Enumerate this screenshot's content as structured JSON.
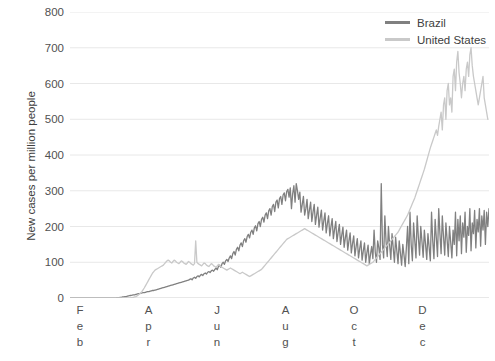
{
  "chart_data": {
    "type": "line",
    "title": "",
    "subtitle": "",
    "xlabel": "",
    "ylabel": "New cases per million people",
    "ylim": [
      0,
      800
    ],
    "yticks": [
      0,
      100,
      200,
      300,
      400,
      500,
      600,
      700,
      800
    ],
    "xticks": [
      "Feb",
      "Apr",
      "Jun",
      "Aug",
      "Oct",
      "Dec"
    ],
    "xtick_letters": [
      [
        "F",
        "e",
        "b"
      ],
      [
        "A",
        "p",
        "r"
      ],
      [
        "J",
        "u",
        "n"
      ],
      [
        "A",
        "u",
        "g"
      ],
      [
        "O",
        "c",
        "t"
      ],
      [
        "D",
        "e",
        "c"
      ]
    ],
    "grid": true,
    "legend_position": "top-right",
    "colors": {
      "brazil": "#808080",
      "united_states": "#c9c9c9",
      "grid": "#e8e8e8",
      "text": "#404040"
    },
    "series": [
      {
        "name": "Brazil",
        "color": "#808080",
        "values": [
          0,
          0,
          0,
          0,
          0,
          0,
          0,
          0,
          0,
          0,
          0,
          0,
          0,
          0,
          0,
          0,
          0,
          0,
          0,
          0,
          0,
          0,
          0,
          0,
          0,
          0,
          0,
          0,
          0,
          0,
          0,
          0,
          0,
          0,
          0,
          0,
          0,
          0,
          0,
          1,
          1,
          1,
          2,
          2,
          3,
          3,
          4,
          4,
          5,
          6,
          7,
          7,
          8,
          9,
          9,
          10,
          11,
          12,
          12,
          13,
          14,
          15,
          15,
          16,
          17,
          18,
          18,
          19,
          20,
          21,
          21,
          22,
          23,
          24,
          25,
          26,
          27,
          28,
          29,
          30,
          31,
          32,
          33,
          34,
          35,
          36,
          37,
          38,
          39,
          40,
          41,
          42,
          43,
          44,
          45,
          46,
          47,
          48,
          49,
          50,
          52,
          54,
          51,
          56,
          58,
          55,
          60,
          62,
          59,
          64,
          66,
          63,
          68,
          70,
          67,
          72,
          74,
          71,
          76,
          78,
          75,
          80,
          84,
          79,
          88,
          92,
          86,
          96,
          100,
          94,
          104,
          108,
          102,
          112,
          118,
          110,
          124,
          130,
          120,
          136,
          142,
          132,
          148,
          154,
          144,
          160,
          166,
          156,
          172,
          178,
          168,
          184,
          190,
          178,
          196,
          202,
          188,
          208,
          214,
          200,
          220,
          226,
          212,
          232,
          238,
          222,
          244,
          250,
          232,
          256,
          262,
          242,
          268,
          274,
          252,
          278,
          284,
          262,
          288,
          294,
          272,
          298,
          304,
          282,
          308,
          250,
          292,
          314,
          268,
          320,
          300,
          276,
          296,
          240,
          262,
          284,
          232,
          250,
          276,
          222,
          246,
          268,
          214,
          240,
          262,
          206,
          232,
          254,
          198,
          224,
          246,
          190,
          216,
          238,
          182,
          208,
          230,
          174,
          200,
          222,
          166,
          192,
          214,
          158,
          184,
          206,
          150,
          176,
          198,
          142,
          168,
          190,
          134,
          160,
          182,
          126,
          152,
          174,
          118,
          144,
          166,
          112,
          138,
          160,
          106,
          132,
          154,
          100,
          126,
          148,
          96,
          122,
          144,
          110,
          190,
          128,
          100,
          160,
          140,
          108,
          320,
          150,
          112,
          230,
          158,
          116,
          200,
          148,
          108,
          180,
          140,
          100,
          170,
          132,
          96,
          160,
          126,
          92,
          150,
          120,
          88,
          142,
          200,
          96,
          240,
          150,
          104,
          210,
          160,
          112,
          230,
          170,
          120,
          200,
          158,
          114,
          190,
          150,
          108,
          180,
          142,
          104,
          240,
          160,
          110,
          220,
          168,
          116,
          250,
          180,
          124,
          230,
          172,
          120,
          210,
          164,
          116,
          200,
          156,
          112,
          190,
          150,
          240,
          118,
          220,
          160,
          230,
          124,
          210,
          170,
          240,
          128,
          200,
          175,
          250,
          132,
          210,
          180,
          245,
          140,
          220,
          185,
          250,
          145,
          230,
          190,
          245,
          150,
          240,
          200,
          250
        ]
      },
      {
        "name": "United States",
        "color": "#c9c9c9",
        "values": [
          0,
          0,
          0,
          0,
          0,
          0,
          0,
          0,
          0,
          0,
          0,
          0,
          0,
          0,
          0,
          0,
          0,
          0,
          0,
          0,
          0,
          0,
          0,
          0,
          0,
          0,
          0,
          0,
          0,
          0,
          0,
          0,
          0,
          0,
          0,
          0,
          0,
          0,
          0,
          0,
          0,
          0,
          0,
          0,
          0,
          0,
          0,
          0,
          0,
          0,
          0,
          1,
          1,
          2,
          3,
          4,
          6,
          8,
          11,
          14,
          18,
          23,
          28,
          34,
          40,
          46,
          52,
          58,
          64,
          70,
          74,
          78,
          80,
          82,
          84,
          86,
          88,
          90,
          92,
          96,
          100,
          104,
          106,
          104,
          100,
          98,
          102,
          106,
          104,
          100,
          98,
          96,
          100,
          104,
          102,
          98,
          96,
          94,
          98,
          102,
          100,
          96,
          94,
          92,
          96,
          160,
          100,
          96,
          94,
          92,
          90,
          94,
          98,
          96,
          92,
          90,
          88,
          92,
          96,
          94,
          90,
          88,
          86,
          90,
          94,
          92,
          88,
          86,
          84,
          82,
          80,
          78,
          80,
          82,
          84,
          82,
          80,
          78,
          76,
          74,
          72,
          70,
          68,
          70,
          72,
          70,
          68,
          66,
          64,
          62,
          60,
          62,
          64,
          66,
          68,
          70,
          72,
          74,
          76,
          78,
          80,
          84,
          88,
          92,
          96,
          100,
          104,
          108,
          112,
          116,
          120,
          124,
          128,
          132,
          136,
          140,
          144,
          148,
          152,
          156,
          160,
          164,
          166,
          168,
          170,
          172,
          174,
          176,
          178,
          180,
          182,
          184,
          186,
          188,
          190,
          192,
          194,
          192,
          190,
          188,
          186,
          184,
          182,
          180,
          178,
          176,
          174,
          172,
          170,
          168,
          166,
          164,
          162,
          160,
          158,
          156,
          154,
          152,
          150,
          148,
          146,
          144,
          142,
          140,
          138,
          136,
          134,
          132,
          130,
          128,
          126,
          124,
          122,
          120,
          118,
          116,
          114,
          112,
          110,
          108,
          106,
          104,
          102,
          100,
          98,
          96,
          94,
          92,
          90,
          92,
          94,
          96,
          98,
          100,
          104,
          108,
          112,
          116,
          120,
          124,
          128,
          132,
          136,
          140,
          144,
          148,
          152,
          156,
          160,
          164,
          168,
          172,
          176,
          180,
          184,
          190,
          196,
          202,
          208,
          214,
          220,
          226,
          232,
          240,
          248,
          256,
          264,
          272,
          280,
          290,
          300,
          310,
          320,
          330,
          340,
          350,
          360,
          372,
          384,
          396,
          408,
          420,
          430,
          440,
          450,
          460,
          470,
          455,
          480,
          500,
          520,
          470,
          540,
          560,
          500,
          580,
          600,
          540,
          560,
          520,
          620,
          640,
          580,
          660,
          690,
          630,
          600,
          560,
          600,
          620,
          580,
          640,
          660,
          620,
          680,
          700,
          650,
          620,
          600,
          580,
          560,
          540,
          560,
          580,
          600,
          620,
          560,
          540,
          520,
          500
        ]
      }
    ]
  },
  "legend": {
    "items": [
      {
        "label": "Brazil",
        "color": "#808080"
      },
      {
        "label": "United States",
        "color": "#c9c9c9"
      }
    ]
  },
  "axes": {
    "y_title": "New cases per million people"
  }
}
